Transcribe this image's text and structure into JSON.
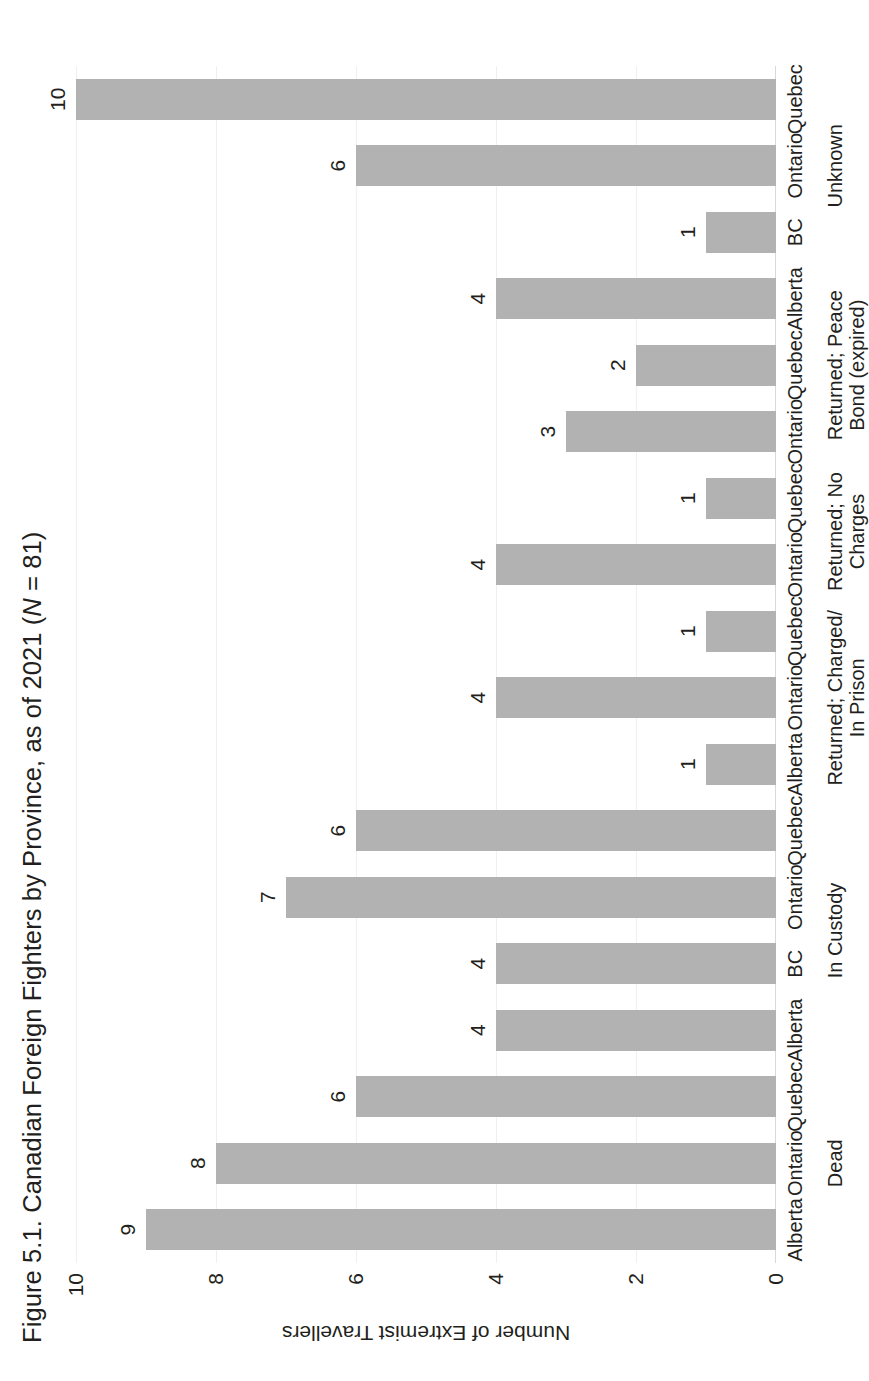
{
  "figure": {
    "title_prefix": "Figure 5.1. Canadian Foreign Fighters by Province, as of 2021 (",
    "title_italic": "N",
    "title_suffix": " = 81)",
    "title_full": "Figure 5.1. Canadian Foreign Fighters by Province, as of 2021 (N = 81)"
  },
  "chart_data": {
    "type": "bar",
    "orientation": "vertical",
    "title": "Figure 5.1. Canadian Foreign Fighters by Province, as of 2021 (N = 81)",
    "xlabel": "",
    "ylabel": "Number of Extremist Travellers",
    "ylim": [
      0,
      10
    ],
    "yticks": [
      0,
      2,
      4,
      6,
      8,
      10
    ],
    "grid": true,
    "legend": "none",
    "bar_color": "#b2b2b2",
    "total": 81,
    "categories": [
      "Alberta",
      "Ontario",
      "Quebec",
      "Alberta",
      "BC",
      "Ontario",
      "Quebec",
      "Alberta",
      "Ontario",
      "Quebec",
      "Ontario",
      "Quebec",
      "Ontario",
      "Quebec",
      "Alberta",
      "BC",
      "Ontario",
      "Quebec"
    ],
    "values": [
      9,
      8,
      6,
      4,
      4,
      7,
      6,
      1,
      4,
      1,
      4,
      1,
      3,
      2,
      4,
      1,
      6,
      10
    ],
    "groups": [
      {
        "label": "Dead",
        "span": 3,
        "provinces": [
          "Alberta",
          "Ontario",
          "Quebec"
        ],
        "values": [
          9,
          8,
          6
        ]
      },
      {
        "label": "In Custody",
        "span": 4,
        "provinces": [
          "Alberta",
          "BC",
          "Ontario",
          "Quebec"
        ],
        "values": [
          4,
          4,
          7,
          6
        ]
      },
      {
        "label": "Returned; Charged/\nIn Prison",
        "span": 3,
        "provinces": [
          "Alberta",
          "Ontario",
          "Quebec"
        ],
        "values": [
          1,
          4,
          1
        ]
      },
      {
        "label": "Returned; No\nCharges",
        "span": 2,
        "provinces": [
          "Ontario",
          "Quebec"
        ],
        "values": [
          4,
          1
        ]
      },
      {
        "label": "Returned; Peace\nBond (expired)",
        "span": 3,
        "provinces": [
          "Ontario",
          "Quebec",
          "Alberta"
        ],
        "values": [
          3,
          2,
          4
        ]
      },
      {
        "label": "Unknown",
        "span": 3,
        "provinces": [
          "BC",
          "Ontario",
          "Quebec"
        ],
        "values": [
          1,
          6,
          10
        ]
      }
    ]
  }
}
